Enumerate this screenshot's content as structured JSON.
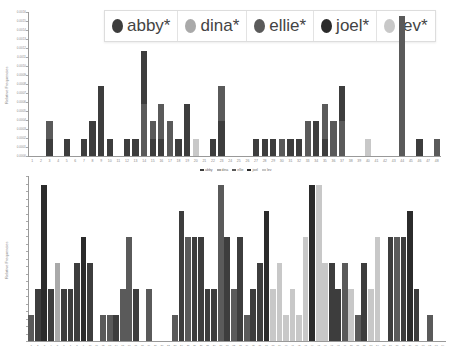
{
  "legend": {
    "items": [
      {
        "label": "abby*",
        "color": "#3d3d3d"
      },
      {
        "label": "dina*",
        "color": "#a9a9a9"
      },
      {
        "label": "ellie*",
        "color": "#5a5a5a"
      },
      {
        "label": "joel*",
        "color": "#2b2b2b"
      },
      {
        "label": "lev*",
        "color": "#c8c8c8"
      }
    ]
  },
  "small_legend": {
    "items": [
      {
        "label": "abby",
        "color": "#3d3d3d"
      },
      {
        "label": "dina",
        "color": "#a9a9a9"
      },
      {
        "label": "ellie",
        "color": "#5a5a5a"
      },
      {
        "label": "joel",
        "color": "#2b2b2b"
      },
      {
        "label": "lev",
        "color": "#c8c8c8"
      }
    ]
  },
  "chart_data": [
    {
      "type": "bar",
      "stacked": true,
      "title": "",
      "xlabel": "",
      "ylabel": "Relative Frequencies",
      "ylim": [
        0,
        0.0016
      ],
      "y_ticks": [
        "0.0000",
        "0.0001",
        "0.0002",
        "0.0003",
        "0.0004",
        "0.0005",
        "0.0006",
        "0.0007",
        "0.0008",
        "0.0009",
        "0.0010",
        "0.0011",
        "0.0012",
        "0.0013",
        "0.0014",
        "0.0015",
        "0.0016"
      ],
      "categories": [
        "1",
        "2",
        "3",
        "4",
        "5",
        "6",
        "7",
        "8",
        "9",
        "10",
        "11",
        "12",
        "13",
        "14",
        "15",
        "16",
        "17",
        "18",
        "19",
        "20",
        "21",
        "22",
        "23",
        "24",
        "25",
        "26",
        "27",
        "28",
        "29",
        "30",
        "31",
        "32",
        "33",
        "34",
        "35",
        "36",
        "37",
        "38",
        "39",
        "40",
        "41",
        "42",
        "43",
        "44",
        "45",
        "46",
        "47",
        "48"
      ],
      "units": [
        0,
        0,
        2,
        0,
        1,
        0,
        1,
        2,
        4,
        1,
        0,
        1,
        1,
        6,
        2,
        3,
        2,
        1,
        3,
        1,
        0,
        1,
        4,
        0,
        0,
        0,
        1,
        1,
        1,
        1,
        1,
        1,
        2,
        2,
        3,
        2,
        4,
        0,
        0,
        1,
        0,
        0,
        0,
        8,
        0,
        1,
        0,
        1
      ],
      "top_color": [
        "",
        "",
        "#5a5a5a",
        "",
        "#3d3d3d",
        "",
        "#3d3d3d",
        "#3d3d3d",
        "#3d3d3d",
        "#3d3d3d",
        "",
        "#3d3d3d",
        "#3d3d3d",
        "#3d3d3d",
        "#5a5a5a",
        "#5a5a5a",
        "#5a5a5a",
        "#3d3d3d",
        "#3d3d3d",
        "#c8c8c8",
        "",
        "#3d3d3d",
        "#5a5a5a",
        "",
        "",
        "",
        "#3d3d3d",
        "#3d3d3d",
        "#3d3d3d",
        "#5a5a5a",
        "#3d3d3d",
        "#3d3d3d",
        "#5a5a5a",
        "#3d3d3d",
        "#5a5a5a",
        "#5a5a5a",
        "#3d3d3d",
        "",
        "",
        "#c8c8c8",
        "",
        "",
        "",
        "#5a5a5a",
        "",
        "#3d3d3d",
        "",
        "#5a5a5a"
      ],
      "bottom_color": [
        "",
        "",
        "#3d3d3d",
        "",
        "#3d3d3d",
        "",
        "#3d3d3d",
        "#3d3d3d",
        "#3d3d3d",
        "#3d3d3d",
        "",
        "#3d3d3d",
        "#3d3d3d",
        "#5a5a5a",
        "#3d3d3d",
        "#3d3d3d",
        "#5a5a5a",
        "#3d3d3d",
        "#3d3d3d",
        "#c8c8c8",
        "",
        "#3d3d3d",
        "#3d3d3d",
        "",
        "",
        "",
        "#3d3d3d",
        "#3d3d3d",
        "#3d3d3d",
        "#5a5a5a",
        "#3d3d3d",
        "#3d3d3d",
        "#5a5a5a",
        "#3d3d3d",
        "#3d3d3d",
        "#5a5a5a",
        "#5a5a5a",
        "",
        "",
        "#c8c8c8",
        "",
        "",
        "",
        "#5a5a5a",
        "",
        "#3d3d3d",
        "",
        "#5a5a5a"
      ]
    },
    {
      "type": "bar",
      "stacked": true,
      "title": "",
      "xlabel": "",
      "ylabel": "Relative Frequencies",
      "categories": [
        "1",
        "2",
        "3",
        "4",
        "5",
        "6",
        "7",
        "8",
        "9",
        "10",
        "11",
        "12",
        "13",
        "14",
        "15",
        "16",
        "17",
        "18",
        "19",
        "20",
        "21",
        "22",
        "23",
        "24",
        "25",
        "26",
        "27",
        "28",
        "29",
        "30",
        "31",
        "32",
        "33",
        "34",
        "35",
        "36",
        "37",
        "38",
        "39",
        "40",
        "41",
        "42",
        "43",
        "44",
        "45",
        "46",
        "47",
        "48",
        "49",
        "50",
        "51",
        "52",
        "53",
        "54",
        "55",
        "56",
        "57",
        "58",
        "59",
        "60",
        "61",
        "62",
        "63",
        "64"
      ],
      "units": [
        1,
        2,
        6,
        2,
        3,
        2,
        2,
        3,
        4,
        3,
        0,
        1,
        1,
        1,
        2,
        4,
        2,
        0,
        2,
        0,
        0,
        0,
        1,
        5,
        4,
        4,
        4,
        2,
        2,
        6,
        4,
        2,
        4,
        1,
        2,
        3,
        5,
        2,
        3,
        1,
        2,
        1,
        4,
        6,
        6,
        3,
        3,
        2,
        3,
        2,
        1,
        3,
        2,
        4,
        0,
        4,
        4,
        4,
        5,
        2,
        0,
        1,
        0,
        0
      ],
      "colors": [
        "#5a5a5a",
        "#3d3d3d",
        "#2b2b2b",
        "#3d3d3d",
        "#a9a9a9",
        "#3d3d3d",
        "#3d3d3d",
        "#3d3d3d",
        "#2b2b2b",
        "#3d3d3d",
        "",
        "#5a5a5a",
        "#5a5a5a",
        "#3d3d3d",
        "#5a5a5a",
        "#5a5a5a",
        "#3d3d3d",
        "",
        "#5a5a5a",
        "",
        "",
        "",
        "#5a5a5a",
        "#3d3d3d",
        "#5a5a5a",
        "#3d3d3d",
        "#3d3d3d",
        "#3d3d3d",
        "#3d3d3d",
        "#5a5a5a",
        "#3d3d3d",
        "#5a5a5a",
        "#3d3d3d",
        "#5a5a5a",
        "#3d3d3d",
        "#3d3d3d",
        "#2b2b2b",
        "#c8c8c8",
        "#c8c8c8",
        "#c8c8c8",
        "#c8c8c8",
        "#c8c8c8",
        "#c8c8c8",
        "#2b2b2b",
        "#c8c8c8",
        "#c8c8c8",
        "#3d3d3d",
        "#3d3d3d",
        "#5a5a5a",
        "#c8c8c8",
        "#5a5a5a",
        "#3d3d3d",
        "#c8c8c8",
        "#c8c8c8",
        "",
        "#3d3d3d",
        "#5a5a5a",
        "#3d3d3d",
        "#2b2b2b",
        "#3d3d3d",
        "",
        "#5a5a5a",
        "",
        ""
      ]
    }
  ]
}
